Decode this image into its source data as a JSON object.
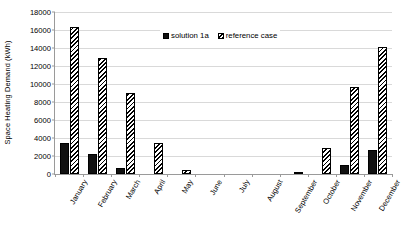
{
  "chart_data": {
    "type": "bar",
    "title": "",
    "xlabel": "",
    "ylabel": "Space Heating Demand (kWh)",
    "ylim": [
      0,
      18000
    ],
    "ytick_step": 2000,
    "yticks": [
      0,
      2000,
      4000,
      6000,
      8000,
      10000,
      12000,
      14000,
      16000,
      18000
    ],
    "grid": true,
    "legend_position": "top-center",
    "categories": [
      "January",
      "February",
      "March",
      "April",
      "May",
      "June",
      "July",
      "August",
      "September",
      "October",
      "November",
      "December"
    ],
    "series": [
      {
        "name": "solution 1a",
        "fill": "solid-black",
        "color": "#111111",
        "values": [
          3400,
          2200,
          700,
          0,
          0,
          0,
          0,
          0,
          0,
          0,
          1000,
          2700
        ]
      },
      {
        "name": "reference case",
        "fill": "diagonal-hatch",
        "color": "#000000",
        "values": [
          16300,
          12900,
          9000,
          3400,
          500,
          0,
          0,
          0,
          150,
          2900,
          9700,
          14100
        ]
      }
    ]
  },
  "legend": {
    "entries": [
      {
        "label": "solution 1a"
      },
      {
        "label": "reference case"
      }
    ]
  },
  "axis": {
    "y_title": "Space Heating Demand (kWh)"
  }
}
